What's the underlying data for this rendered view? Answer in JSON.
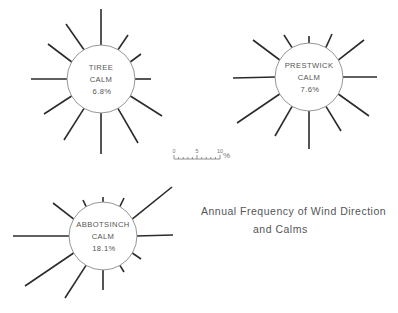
{
  "title": {
    "line1": "Annual Frequency of Wind Direction",
    "line2": "and Calms"
  },
  "scale": {
    "labels": [
      "0",
      "5",
      "10"
    ],
    "unit": "%",
    "subdivisions": 10
  },
  "colors": {
    "spoke": "#2b2b2b",
    "hub_outline": "#8a8a8a",
    "text": "#555555"
  },
  "chart_data": {
    "type": "wind-rose",
    "directions_deg": [
      0,
      30,
      60,
      90,
      120,
      150,
      180,
      210,
      240,
      270,
      300,
      330
    ],
    "scale_units": "% (spoke length beyond hub; 10% ≈ 23px)",
    "stations": [
      {
        "name": "TIREE",
        "calm_label": "CALM",
        "calm_value": "6.8%",
        "center": [
          101,
          79
        ],
        "hub_radius": 34,
        "spoke_ends": [
          [
            101,
            9
          ],
          [
            128,
            35
          ],
          [
            141,
            54
          ],
          [
            151,
            79
          ],
          [
            162,
            116
          ],
          [
            138,
            143
          ],
          [
            101,
            154
          ],
          [
            64,
            140
          ],
          [
            44,
            114
          ],
          [
            31,
            79
          ],
          [
            48,
            44
          ],
          [
            66,
            24
          ]
        ]
      },
      {
        "name": "PRESTWICK",
        "calm_label": "CALM",
        "calm_value": "7.6%",
        "center": [
          309,
          77
        ],
        "hub_radius": 34,
        "spoke_ends": [
          [
            309,
            36
          ],
          [
            332,
            34
          ],
          [
            364,
            40
          ],
          [
            377,
            77
          ],
          [
            369,
            116
          ],
          [
            341,
            131
          ],
          [
            309,
            149
          ],
          [
            275,
            136
          ],
          [
            237,
            123
          ],
          [
            233,
            78
          ],
          [
            253,
            40
          ],
          [
            284,
            35
          ]
        ]
      },
      {
        "name": "ABBOTSINCH",
        "calm_label": "CALM",
        "calm_value": "18.1%",
        "center": [
          103,
          236
        ],
        "hub_radius": 34,
        "spoke_ends": [
          [
            103,
            197
          ],
          [
            124,
            198
          ],
          [
            172,
            187
          ],
          [
            173,
            235
          ],
          [
            141,
            259
          ],
          [
            124,
            272
          ],
          [
            103,
            290
          ],
          [
            65,
            298
          ],
          [
            25,
            286
          ],
          [
            13,
            236
          ],
          [
            53,
            203
          ],
          [
            83,
            200
          ]
        ]
      }
    ]
  }
}
